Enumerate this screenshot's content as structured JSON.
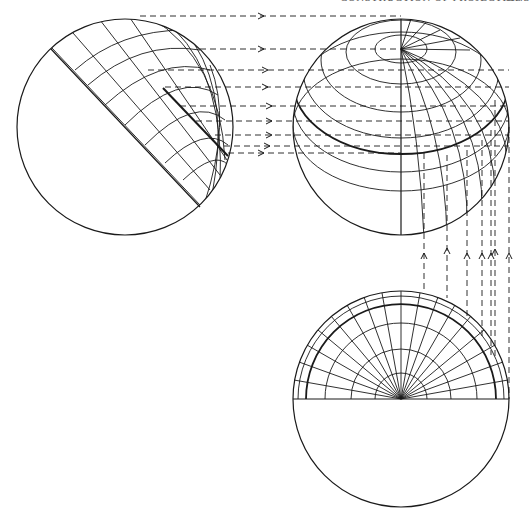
{
  "header": {
    "running_title": "CONSTRUCTION OF PROJECTIONS",
    "page_number": "113"
  },
  "style": {
    "ink": "#1a1a1a",
    "background": "#ffffff"
  },
  "figure": {
    "views": [
      {
        "id": "oblique-view",
        "cx": 125,
        "cy": 127,
        "r": 108
      },
      {
        "id": "side-view",
        "cx": 401,
        "cy": 127,
        "r": 108,
        "pole_y": 49
      },
      {
        "id": "polar-view",
        "cx": 401,
        "cy": 399,
        "r": 108
      }
    ],
    "horizontal_projection_lines_y": [
      16,
      49,
      70,
      87,
      106,
      121,
      135,
      146,
      153
    ],
    "vertical_projection_lines_x": [
      424,
      447,
      467,
      482,
      491,
      495,
      509
    ],
    "polar_arc_radii": [
      26,
      50,
      76,
      95,
      103,
      108
    ],
    "polar_bold_arc_radius": 95,
    "polar_meridian_count": 18
  }
}
